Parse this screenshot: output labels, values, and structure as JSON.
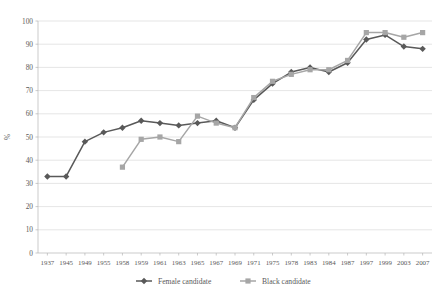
{
  "chart_data": {
    "type": "line",
    "title": "",
    "xlabel": "",
    "ylabel": "%",
    "ylim": [
      0,
      100
    ],
    "ytick_step": 10,
    "grid": true,
    "legend_position": "bottom",
    "categories": [
      "1937",
      "1945",
      "1949",
      "1955",
      "1958",
      "1959",
      "1961",
      "1963",
      "1965",
      "1967",
      "1969",
      "1971",
      "1975",
      "1978",
      "1983",
      "1984",
      "1987",
      "1997",
      "1999",
      "2003",
      "2007"
    ],
    "yticks": [
      "0",
      "10",
      "20",
      "30",
      "40",
      "50",
      "60",
      "70",
      "80",
      "90",
      "100"
    ],
    "series": [
      {
        "name": "Female candidate",
        "color": "#595959",
        "marker": "diamond",
        "values": [
          33,
          33,
          48,
          52,
          54,
          57,
          56,
          55,
          56,
          57,
          54,
          66,
          73,
          78,
          80,
          78,
          82,
          92,
          94,
          89,
          88
        ]
      },
      {
        "name": "Black candidate",
        "color": "#a6a6a6",
        "marker": "square",
        "values": [
          null,
          null,
          null,
          null,
          37,
          49,
          50,
          48,
          59,
          56,
          54,
          67,
          74,
          77,
          79,
          79,
          83,
          95,
          95,
          93,
          95
        ]
      }
    ]
  },
  "legend": {
    "items": [
      {
        "label": "Female candidate",
        "color": "#595959"
      },
      {
        "label": "Black candidate",
        "color": "#a6a6a6"
      }
    ]
  },
  "axis": {
    "y_title": "%"
  }
}
